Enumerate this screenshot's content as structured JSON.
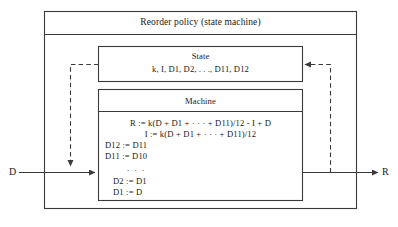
{
  "diagram": {
    "type": "block-diagram",
    "outer_box": {
      "title": "Reorder policy (state machine)"
    },
    "state_box": {
      "title": "State",
      "variables": "k, I, D1, D2, . . ., D11, D12"
    },
    "machine_box": {
      "title": "Machine",
      "equations": [
        "R := k(D + D1 + · · · + D11)/12 - I + D",
        "I := k(D + D1 + · · · + D11)/12",
        "D12 := D11",
        "D11 := D10",
        ". . .",
        "D2 := D1",
        "D1 := D"
      ]
    },
    "io": {
      "input_label": "D",
      "output_label": "R"
    },
    "colors": {
      "stroke": "#3a3a3a",
      "text": "#1a1a1a",
      "background": "#ffffff"
    }
  }
}
